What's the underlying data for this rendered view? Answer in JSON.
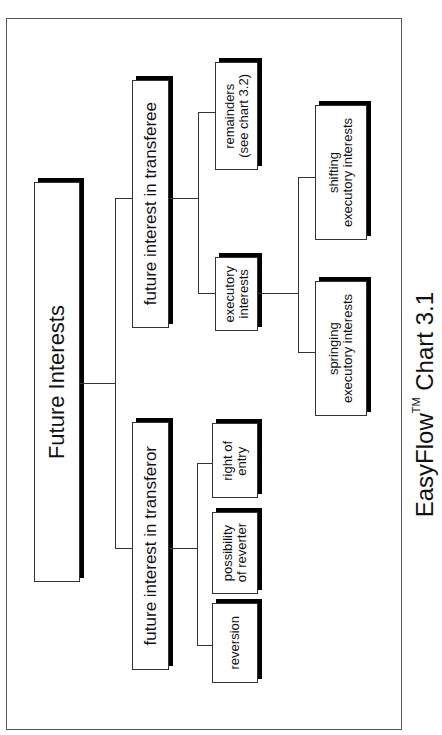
{
  "diagram": {
    "orientation": "rotated 90° counter-clockwise (reads bottom-to-top)",
    "root": {
      "label": "Future Interests"
    },
    "branches": [
      {
        "label": "future interest in transferee",
        "children": [
          {
            "label_line1": "remainders",
            "label_line2": "(see chart 3.2)"
          },
          {
            "label_line1": "executory",
            "label_line2": "interests",
            "children": [
              {
                "label_line1": "shifting",
                "label_line2": "executory interests"
              },
              {
                "label_line1": "springing",
                "label_line2": "executory interests"
              }
            ]
          }
        ]
      },
      {
        "label": "future interest in transferor",
        "children": [
          {
            "label_line1": "right of",
            "label_line2": "entry"
          },
          {
            "label_line1": "possibility",
            "label_line2": "of reverter"
          },
          {
            "label_line1": "reversion"
          }
        ]
      }
    ]
  },
  "caption": {
    "prefix": "EasyFlow",
    "trademark": "TM",
    "suffix": " Chart 3.1"
  },
  "colors": {
    "line": "#333333",
    "shadow": "#000000",
    "background": "#ffffff"
  }
}
